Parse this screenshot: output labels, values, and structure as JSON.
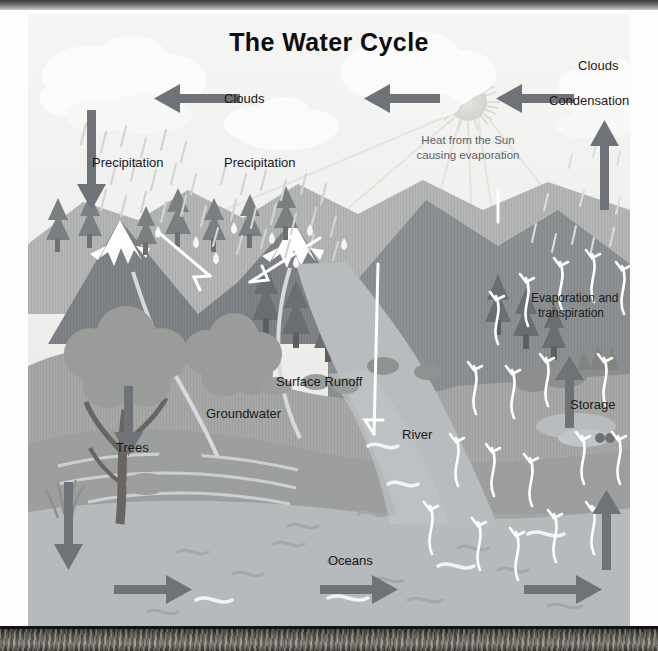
{
  "diagram": {
    "title": "The Water Cycle",
    "type": "water-cycle-illustration",
    "colors": {
      "sky": "#eeeeec",
      "arrow_gray": "#6f7276",
      "cloud_white": "#fbfbfb",
      "mountain_dark": "#8c8f93",
      "mountain_mid": "#9ea0a3",
      "hill_green": "#a7a9a8",
      "water_blue": "#b9bcbe",
      "label_text": "#1a1a1a",
      "sun_text": "#5d6166",
      "snow_white": "#ffffff"
    },
    "labels": {
      "clouds_top_left": "Clouds",
      "clouds_top_right": "Clouds",
      "condensation": "Condensation",
      "precipitation_left": "Precipitation",
      "precipitation_right": "Precipitation",
      "sun_note_line1": "Heat from the Sun",
      "sun_note_line2": "causing evaporation",
      "sun_note": "Heat from the Sun causing evaporation",
      "evaporation_line1": "Evaporation and",
      "evaporation_line2": "transpiration",
      "evaporation": "Evaporation and transpiration",
      "surface_runoff": "Surface Runoff",
      "groundwater": "Groundwater",
      "storage": "Storage",
      "trees": "Trees",
      "river": "River",
      "oceans": "Oceans"
    },
    "flow_arrows": [
      {
        "name": "clouds-left-arrow",
        "direction": "left",
        "meaning": "cloud movement toward precipitation"
      },
      {
        "name": "clouds-center-arrow",
        "direction": "left",
        "meaning": "cloud movement from sun region"
      },
      {
        "name": "clouds-right-arrow",
        "direction": "left",
        "meaning": "cloud movement from condensation"
      },
      {
        "name": "precipitation-down-arrow",
        "direction": "down",
        "meaning": "rain falling to ground"
      },
      {
        "name": "condensation-up-arrow",
        "direction": "up",
        "meaning": "vapour rising to condense"
      },
      {
        "name": "evaporation-up-arrow",
        "direction": "up",
        "meaning": "evaporation from storage"
      },
      {
        "name": "ocean-evaporation-arrow",
        "direction": "up",
        "meaning": "evaporation from ocean"
      },
      {
        "name": "infiltration-down-arrow",
        "direction": "down",
        "meaning": "water moving into groundwater"
      },
      {
        "name": "ocean-flow-arrow-left",
        "direction": "right",
        "meaning": "ocean current"
      },
      {
        "name": "ocean-flow-arrow-center",
        "direction": "right",
        "meaning": "ocean current"
      },
      {
        "name": "ocean-flow-arrow-right",
        "direction": "right",
        "meaning": "ocean current"
      }
    ]
  }
}
